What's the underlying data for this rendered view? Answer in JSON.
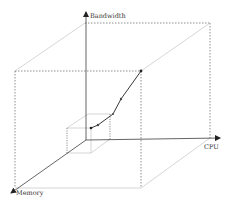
{
  "diagram": {
    "type": "3d-axes-scaling-diagram",
    "axes": {
      "y_label": "Bandwidth",
      "x_label": "CPU",
      "z_label": "Memory"
    },
    "curve": {
      "description": "scaling trajectory from small box corner to large box corner",
      "points": [
        {
          "x": 91,
          "y": 128
        },
        {
          "x": 98,
          "y": 125
        },
        {
          "x": 113,
          "y": 114
        },
        {
          "x": 121,
          "y": 99
        },
        {
          "x": 141,
          "y": 71
        }
      ]
    },
    "colors": {
      "axis": "#222222",
      "box_solid": "#bbbbbb",
      "box_dashed": "#444444",
      "curve": "#222222"
    }
  }
}
